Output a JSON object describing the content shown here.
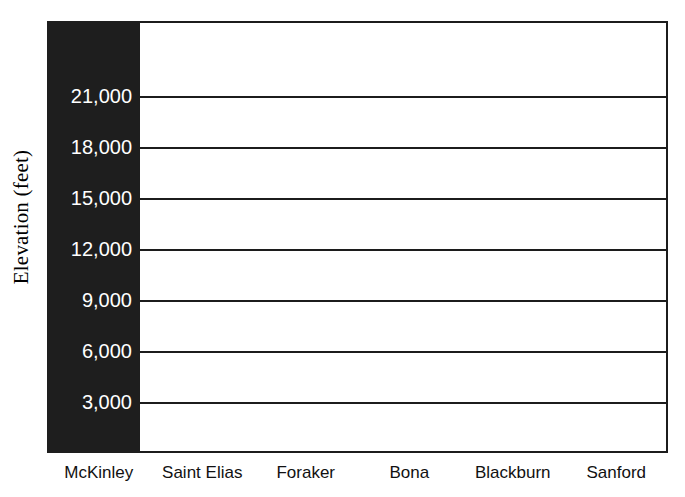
{
  "chart_data": {
    "type": "bar",
    "title": "",
    "xlabel": "",
    "ylabel": "Elevation (feet)",
    "categories": [
      "McKinley",
      "Saint Elias",
      "Foraker",
      "Bona",
      "Blackburn",
      "Sanford"
    ],
    "values": [
      20320,
      null,
      null,
      null,
      null,
      null
    ],
    "series": [
      {
        "name": "Elevation",
        "values": [
          20320,
          null,
          null,
          null,
          null,
          null
        ]
      }
    ],
    "ylim": [
      0,
      22500
    ],
    "ytick_values": [
      3000,
      6000,
      9000,
      12000,
      15000,
      18000,
      21000
    ],
    "ytick_labels": [
      "3,000",
      "6,000",
      "9,000",
      "12,000",
      "15,000",
      "18,000",
      "21,000"
    ],
    "grid": "horizontal",
    "legend": "none",
    "bar_color": "#333333",
    "axis_color": "#1c1c1c",
    "tick_band_color": "#1e1e1e",
    "tick_label_color": "#ffffff",
    "background_color": "#ffffff"
  }
}
